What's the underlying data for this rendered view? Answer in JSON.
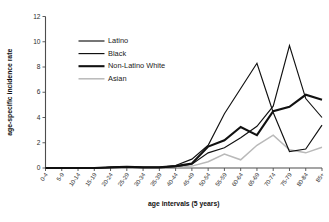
{
  "chart_data": {
    "type": "line",
    "title": "",
    "xlabel": "age intervals (5 years)",
    "ylabel": "age-specific incidence rate",
    "categories": [
      "0-4",
      "5-9",
      "10-14",
      "15-19",
      "20-24",
      "25-29",
      "30-34",
      "35-39",
      "40-44",
      "45-49",
      "50-54",
      "55-59",
      "60-64",
      "65-69",
      "70-74",
      "75-79",
      "80-84",
      "85+"
    ],
    "ylim": [
      0,
      12
    ],
    "yticks": [
      0,
      2,
      4,
      6,
      8,
      10,
      12
    ],
    "grid": false,
    "legend_position": "upper-left",
    "series": [
      {
        "name": "Latino",
        "color": "#111111",
        "line_width": 1.15,
        "values": [
          0,
          0,
          0,
          0,
          0.05,
          0.1,
          0.05,
          0.05,
          0.1,
          0.3,
          1.2,
          1.6,
          2.4,
          3.3,
          4.9,
          9.7,
          5.5,
          4.0
        ]
      },
      {
        "name": "Black",
        "color": "#111111",
        "line_width": 1.15,
        "values": [
          0,
          0,
          0,
          0,
          0.05,
          0.1,
          0.05,
          0.05,
          0.2,
          0.7,
          1.8,
          4.3,
          6.3,
          8.3,
          4.4,
          1.3,
          1.5,
          3.4
        ]
      },
      {
        "name": "Non-Latino White",
        "color": "#111111",
        "line_width": 2.1,
        "values": [
          0,
          0,
          0,
          0,
          0.05,
          0.1,
          0.05,
          0.05,
          0.15,
          0.35,
          1.7,
          2.2,
          3.25,
          2.6,
          4.5,
          4.85,
          5.8,
          5.4
        ]
      },
      {
        "name": "Asian",
        "color": "#b9b9b9",
        "line_width": 1.5,
        "values": [
          0,
          0,
          0,
          0,
          0.05,
          0.1,
          0.05,
          0.05,
          0.1,
          0.15,
          0.5,
          1.1,
          0.65,
          1.8,
          2.6,
          1.45,
          1.2,
          1.65
        ]
      }
    ]
  },
  "legend": {
    "items": [
      {
        "label": "Latino"
      },
      {
        "label": "Black"
      },
      {
        "label": "Non-Latino White"
      },
      {
        "label": "Asian"
      }
    ]
  },
  "axes": {
    "y_label": "age-specific incidence rate",
    "x_label": "age intervals (5 years)",
    "y_tick_labels": [
      "0",
      "2",
      "4",
      "6",
      "8",
      "10",
      "12"
    ],
    "x_tick_labels": [
      "0-4",
      "5-9",
      "10-14",
      "15-19",
      "20-24",
      "25-29",
      "30-34",
      "35-39",
      "40-44",
      "45-49",
      "50-54",
      "55-59",
      "60-64",
      "65-69",
      "70-74",
      "75-79",
      "80-84",
      "85+"
    ]
  }
}
